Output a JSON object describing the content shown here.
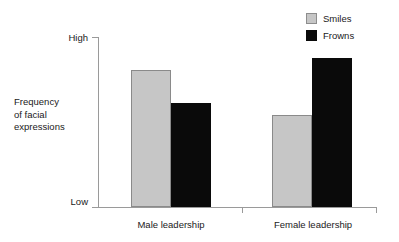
{
  "chart_data": {
    "type": "bar",
    "title": "",
    "subtitle": "",
    "xlabel": "",
    "ylabel": "Frequency of facial expressions",
    "ylabel_lines": [
      "Frequency",
      "of facial",
      "expressions"
    ],
    "categories": [
      "Male leadership",
      "Female leadership"
    ],
    "series": [
      {
        "name": "Smiles",
        "color": "#c6c6c6",
        "values": [
          137,
          92
        ]
      },
      {
        "name": "Frowns",
        "color": "#0a0a0a",
        "values": [
          104,
          149
        ]
      }
    ],
    "y_tick_labels": [
      "High",
      "Low"
    ],
    "ylim": [
      0,
      170
    ],
    "grid": false,
    "legend_position": "top-right",
    "annotations": []
  },
  "axes": {
    "y_top_label": "High",
    "y_bottom_label": "Low",
    "y_title_line1": "Frequency",
    "y_title_line2": "of facial",
    "y_title_line3": "expressions"
  },
  "categories": [
    {
      "label": "Male leadership"
    },
    {
      "label": "Female leadership"
    }
  ],
  "legend": {
    "items": [
      {
        "label": "Smiles",
        "color": "#c6c6c6"
      },
      {
        "label": "Frowns",
        "color": "#0a0a0a"
      }
    ]
  },
  "bars": [
    {
      "name": "male-smiles",
      "series": "Smiles",
      "category": "Male leadership",
      "value": 137
    },
    {
      "name": "male-frowns",
      "series": "Frowns",
      "category": "Male leadership",
      "value": 104
    },
    {
      "name": "female-smiles",
      "series": "Smiles",
      "category": "Female leadership",
      "value": 92
    },
    {
      "name": "female-frowns",
      "series": "Frowns",
      "category": "Female leadership",
      "value": 149
    }
  ],
  "colors": {
    "smiles": "#c6c6c6",
    "smiles_border": "#8a8a8a",
    "frowns": "#0a0a0a",
    "axis": "#9a9a9a",
    "text": "#1a1a1a",
    "background": "#ffffff"
  }
}
